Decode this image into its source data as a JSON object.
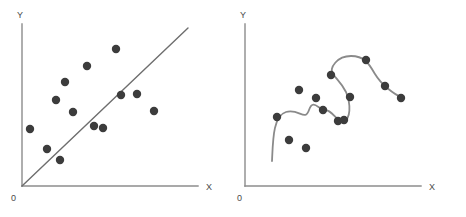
{
  "figure": {
    "background_color": "#ffffff",
    "width": 466,
    "height": 217,
    "point_color": "#3c3c3c",
    "axis_color": "#8c8c8c",
    "line_color": "#6e6e6e",
    "curve_color": "#8a8a8a",
    "point_radius": 4.2
  },
  "chart_data": [
    {
      "type": "scatter",
      "id": "left",
      "title": "",
      "xlabel": "X",
      "ylabel": "Y",
      "origin_label": "0",
      "xlim": [
        0,
        200
      ],
      "ylim": [
        0,
        200
      ],
      "grid": false,
      "legend": "none",
      "series": [
        {
          "name": "observations",
          "marker": "filled-circle",
          "color": "#3c3c3c",
          "x": [
            15,
            32,
            41,
            45,
            50,
            58,
            72,
            79,
            88,
            101,
            106,
            122,
            139
          ],
          "y": [
            63,
            43,
            92,
            32,
            110,
            80,
            126,
            66,
            64,
            143,
            97,
            98,
            81
          ]
        },
        {
          "name": "linear-fit",
          "type": "line",
          "color": "#6e6e6e",
          "x": [
            0,
            166
          ],
          "y": [
            0,
            180
          ]
        }
      ],
      "points_px": [
        [
          30,
          129
        ],
        [
          47,
          149
        ],
        [
          56,
          100
        ],
        [
          60,
          160
        ],
        [
          65,
          82
        ],
        [
          73,
          112
        ],
        [
          87,
          66
        ],
        [
          94,
          126
        ],
        [
          103,
          128
        ],
        [
          116,
          49
        ],
        [
          121,
          95
        ],
        [
          137,
          94
        ],
        [
          154,
          111
        ]
      ],
      "line_px": [
        [
          22,
          186
        ],
        [
          188,
          28
        ]
      ]
    },
    {
      "type": "scatter",
      "id": "right",
      "title": "",
      "xlabel": "X",
      "ylabel": "Y",
      "origin_label": "0",
      "xlim": [
        0,
        200
      ],
      "ylim": [
        0,
        200
      ],
      "grid": false,
      "legend": "none",
      "series": [
        {
          "name": "observations",
          "marker": "filled-circle",
          "color": "#3c3c3c",
          "x": [
            31,
            44,
            53,
            60,
            70,
            77,
            84,
            91,
            104,
            113,
            128,
            141,
            155
          ],
          "y": [
            68,
            37,
            96,
            28,
            101,
            85,
            62,
            59,
            126,
            111,
            93,
            78,
            75
          ]
        },
        {
          "name": "overfit-curve",
          "type": "spline",
          "color": "#8a8a8a"
        }
      ],
      "points_px": [
        [
          44,
          117
        ],
        [
          56,
          140
        ],
        [
          66,
          90
        ],
        [
          73,
          148
        ],
        [
          83,
          98
        ],
        [
          90,
          110
        ],
        [
          98,
          75
        ],
        [
          105,
          121
        ],
        [
          111,
          120
        ],
        [
          117,
          97
        ],
        [
          133,
          60
        ],
        [
          152,
          86
        ],
        [
          168,
          98
        ]
      ],
      "curve_path": "M 39,161 C 40,140 40,116 53,112 C 66,108 72,122 76,110 C 80,98 86,110 92,110 C 100,110 103,122 110,121 C 118,120 118,104 113,92 C 108,82 104,80 100,74 C 96,68 104,56 118,56 C 132,56 136,64 142,74 C 148,84 160,94 170,98"
    }
  ],
  "annotations": {
    "left_panel_name": "linear-underfit-scatter",
    "right_panel_name": "spline-overfit-scatter"
  }
}
